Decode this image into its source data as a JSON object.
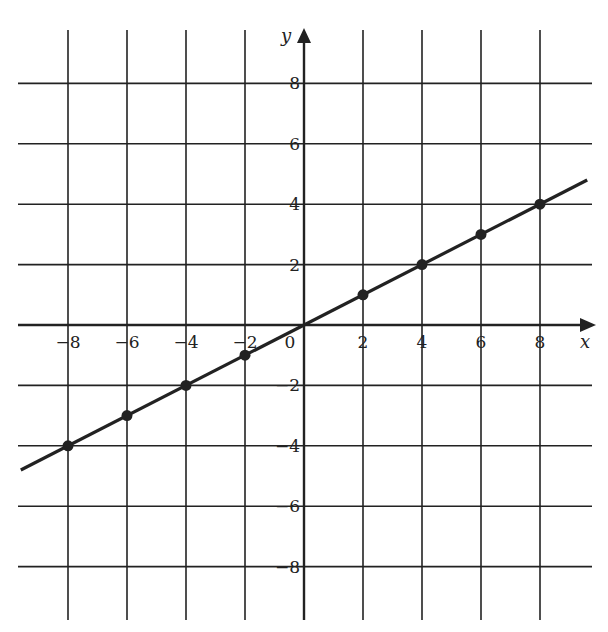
{
  "chart_data": {
    "type": "line",
    "title": "",
    "xlabel": "x",
    "ylabel": "y",
    "xlim": [
      -10,
      10
    ],
    "ylim": [
      -10,
      10
    ],
    "grid": true,
    "x_ticks": [
      "-8",
      "-6",
      "-4",
      "-2",
      "0",
      "2",
      "4",
      "6",
      "8"
    ],
    "y_ticks": [
      "8",
      "6",
      "4",
      "2",
      "-2",
      "-4",
      "-6",
      "-8"
    ],
    "series": [
      {
        "name": "y = x/2",
        "line": {
          "x": [
            -9.6,
            9.6
          ],
          "y": [
            -4.8,
            4.8
          ]
        },
        "points": {
          "x": [
            -8,
            -6,
            -4,
            -2,
            2,
            4,
            6,
            8
          ],
          "y": [
            -4,
            -3,
            -2,
            -1,
            1,
            2,
            3,
            4
          ]
        }
      }
    ]
  },
  "colors": {
    "ink": "#222222",
    "background": "#ffffff"
  }
}
